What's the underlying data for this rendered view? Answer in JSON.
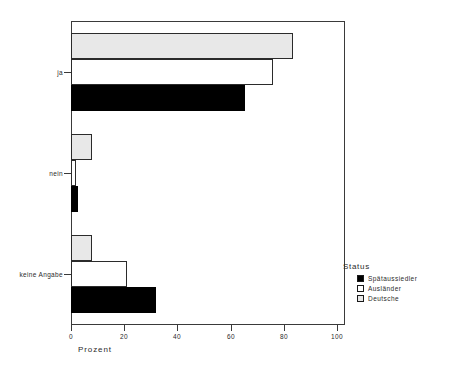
{
  "chart_data": {
    "type": "bar",
    "orientation": "horizontal",
    "title": "",
    "xlabel": "Prozent",
    "ylabel": "",
    "xlim": [
      0,
      100
    ],
    "xticks": [
      "0",
      "20",
      "40",
      "60",
      "80",
      "100"
    ],
    "grid": false,
    "categories": [
      "ja",
      "nein",
      "keine Angabe"
    ],
    "legend_title": "Status",
    "legend_position": "right",
    "series": [
      {
        "name": "Spätaussiedler",
        "color": "#000000",
        "values": [
          65.5,
          2.7,
          32.0
        ]
      },
      {
        "name": "Ausländer",
        "color": "#ffffff",
        "values": [
          76.0,
          2.0,
          21.0
        ]
      },
      {
        "name": "Deutsche",
        "color": "#e8e8e8",
        "values": [
          83.5,
          8.0,
          8.0
        ]
      }
    ]
  },
  "axis": {
    "x_title": "Prozent",
    "ticks": [
      {
        "label": "0",
        "value": 0
      },
      {
        "label": "20",
        "value": 20
      },
      {
        "label": "40",
        "value": 40
      },
      {
        "label": "60",
        "value": 60
      },
      {
        "label": "80",
        "value": 80
      },
      {
        "label": "100",
        "value": 100
      }
    ],
    "categories": [
      {
        "label": "ja"
      },
      {
        "label": "nein"
      },
      {
        "label": "keine Angabe"
      }
    ]
  },
  "legend": {
    "title": "Status",
    "items": [
      {
        "label": "Spätaussiedler",
        "swatch": "black"
      },
      {
        "label": "Ausländer",
        "swatch": "white"
      },
      {
        "label": "Deutsche",
        "swatch": "gray"
      }
    ]
  }
}
